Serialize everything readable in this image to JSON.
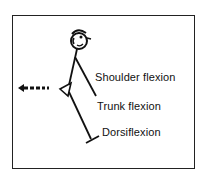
{
  "diagram": {
    "labels": {
      "shoulder": "Shoulder flexion",
      "trunk": "Trunk flexion",
      "ankle": "Dorsiflexion"
    },
    "icons": {
      "figure": "stick-figure-leaning-forward",
      "arrow": "dashed-arrow-left"
    },
    "colors": {
      "ink": "#111111",
      "background": "#ffffff"
    }
  }
}
